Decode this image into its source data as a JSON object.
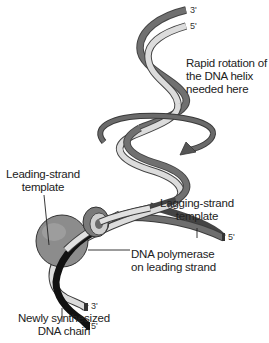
{
  "diagram": {
    "labels": {
      "rotation_line1": "Rapid rotation of",
      "rotation_line2": "the DNA helix",
      "rotation_line3": "needed here",
      "leading_template_line1": "Leading-strand",
      "leading_template_line2": "template",
      "lagging_template_line1": "Lagging-strand",
      "lagging_template_line2": "template",
      "polymerase_line1": "DNA polymerase",
      "polymerase_line2": "on leading strand",
      "new_chain_line1": "Newly synthesized",
      "new_chain_line2": "DNA chain"
    },
    "strand_ends": {
      "top_dark": "3'",
      "top_light": "5'",
      "lagging_end": "5'",
      "leading_light_end": "3'",
      "new_chain_end": "5'"
    },
    "colors": {
      "dark_strand": "#6e6e6e",
      "light_strand": "#d9d9d9",
      "new_chain": "#111111",
      "polymerase": "#8a8a8a",
      "rotation_arrow": "#6a6a6a"
    }
  }
}
